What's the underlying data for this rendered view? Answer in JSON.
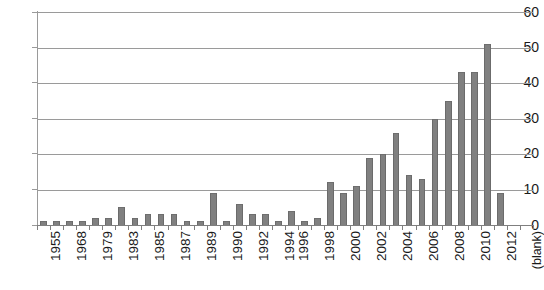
{
  "chart_data": {
    "type": "bar",
    "title": "",
    "subtitle": "",
    "xlabel": "",
    "ylabel": "",
    "ylim": [
      0,
      60
    ],
    "yticks": [
      0,
      10,
      20,
      30,
      40,
      50,
      60
    ],
    "grid": true,
    "legend": false,
    "legend_position": "none",
    "bar_color": "#808080",
    "gridline_color": "#9a9a9a",
    "axis_color": "#7f7f7f",
    "text_color": "#1a1a1a",
    "xtick_rotation": -90,
    "categories": [
      "1955",
      "1963",
      "1968",
      "1975",
      "1979",
      "1981",
      "1983",
      "1984",
      "1985",
      "1986",
      "1987",
      "1988",
      "1989",
      "1990",
      "1991",
      "1992",
      "1993",
      "1994",
      "1995",
      "1996",
      "1997",
      "1998",
      "1999",
      "2000",
      "2001",
      "2002",
      "2003",
      "2004",
      "2005",
      "2006",
      "2007",
      "2008",
      "2009",
      "2010",
      "2011",
      "2012",
      "2013",
      "(blank)"
    ],
    "visible_tick_labels": [
      "1955",
      "1968",
      "1979",
      "1983",
      "1985",
      "1987",
      "1989",
      "1990",
      "1992",
      "1994",
      "1996",
      "1998",
      "2000",
      "2002",
      "2004",
      "2006",
      "2008",
      "2010",
      "2012",
      "(blank)"
    ],
    "values": [
      1,
      1,
      1,
      1,
      2,
      2,
      5,
      2,
      3,
      3,
      3,
      1,
      1,
      9,
      1,
      6,
      3,
      3,
      1,
      4,
      1,
      2,
      12,
      9,
      11,
      19,
      20,
      26,
      14,
      13,
      30,
      35,
      43,
      43,
      51,
      9,
      0,
      0
    ],
    "series": [
      {
        "name": "count",
        "values": [
          1,
          1,
          1,
          1,
          2,
          2,
          5,
          2,
          3,
          3,
          3,
          1,
          1,
          9,
          1,
          6,
          3,
          3,
          1,
          4,
          1,
          2,
          12,
          9,
          11,
          19,
          20,
          26,
          14,
          13,
          30,
          35,
          43,
          43,
          51,
          9,
          0,
          0
        ]
      }
    ]
  },
  "axes": {
    "y_tick_labels": [
      "60",
      "50",
      "40",
      "30",
      "20",
      "10",
      "0"
    ],
    "x_tick_labels": [
      "1955",
      "1968",
      "1979",
      "1983",
      "1985",
      "1987",
      "1989",
      "1990",
      "1992",
      "1994",
      "1996",
      "1998",
      "2000",
      "2002",
      "2004",
      "2006",
      "2008",
      "2010",
      "2012",
      "(blank)"
    ]
  }
}
